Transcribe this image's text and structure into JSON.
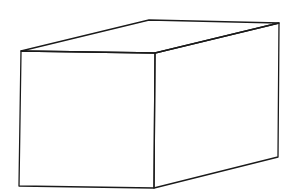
{
  "diagram": {
    "type": "box-prism-line-drawing",
    "stroke_color": "#1a1a1a",
    "background": "#ffffff",
    "vertices": {
      "front_top_left": [
        21,
        51
      ],
      "front_top_right": [
        155,
        53
      ],
      "front_bottom_left": [
        19,
        186
      ],
      "front_bottom_right": [
        154,
        188
      ],
      "back_top_left": [
        149,
        20
      ],
      "back_top_right": [
        279,
        23
      ],
      "back_bottom_right": [
        278,
        157
      ]
    }
  }
}
